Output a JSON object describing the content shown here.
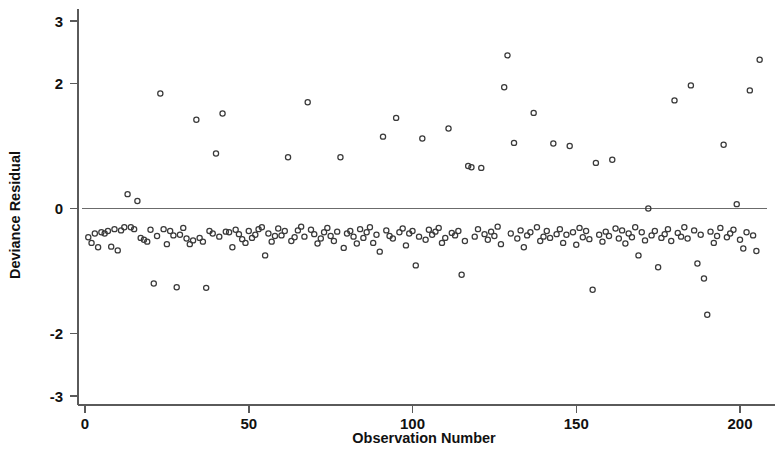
{
  "chart_data": {
    "type": "scatter",
    "title": "",
    "xlabel": "Observation Number",
    "ylabel": "Deviance Residual",
    "xlim": [
      -4,
      212
    ],
    "ylim": [
      -3,
      3
    ],
    "grid": false,
    "legend": null,
    "marker": "open-circle",
    "reference_line": {
      "y": 0,
      "label": "zero-residual-line"
    },
    "xticks": [
      0,
      50,
      100,
      150,
      200
    ],
    "xtick_labels": [
      "0",
      "50",
      "100",
      "150",
      "200"
    ],
    "yticks": [
      3,
      2,
      0,
      -2,
      -3
    ],
    "ytick_labels": [
      "3",
      "2",
      "0",
      "-2",
      "-3"
    ],
    "n_points": 206,
    "x": [
      1,
      2,
      3,
      4,
      5,
      6,
      7,
      8,
      9,
      10,
      11,
      12,
      13,
      14,
      15,
      16,
      17,
      18,
      19,
      20,
      21,
      22,
      23,
      24,
      25,
      26,
      27,
      28,
      29,
      30,
      31,
      32,
      33,
      34,
      35,
      36,
      37,
      38,
      39,
      40,
      41,
      42,
      43,
      44,
      45,
      46,
      47,
      48,
      49,
      50,
      51,
      52,
      53,
      54,
      55,
      56,
      57,
      58,
      59,
      60,
      61,
      62,
      63,
      64,
      65,
      66,
      67,
      68,
      69,
      70,
      71,
      72,
      73,
      74,
      75,
      76,
      77,
      78,
      79,
      80,
      81,
      82,
      83,
      84,
      85,
      86,
      87,
      88,
      89,
      90,
      91,
      92,
      93,
      94,
      95,
      96,
      97,
      98,
      99,
      100,
      101,
      102,
      103,
      104,
      105,
      106,
      107,
      108,
      109,
      110,
      111,
      112,
      113,
      114,
      115,
      116,
      117,
      118,
      119,
      120,
      121,
      122,
      123,
      124,
      125,
      126,
      127,
      128,
      129,
      130,
      131,
      132,
      133,
      134,
      135,
      136,
      137,
      138,
      139,
      140,
      141,
      142,
      143,
      144,
      145,
      146,
      147,
      148,
      149,
      150,
      151,
      152,
      153,
      154,
      155,
      156,
      157,
      158,
      159,
      160,
      161,
      162,
      163,
      164,
      165,
      166,
      167,
      168,
      169,
      170,
      171,
      172,
      173,
      174,
      175,
      176,
      177,
      178,
      179,
      180,
      181,
      182,
      183,
      184,
      185,
      186,
      187,
      188,
      189,
      190,
      191,
      192,
      193,
      194,
      195,
      196,
      197,
      198,
      199,
      200,
      201,
      202,
      203,
      204,
      205,
      206
    ],
    "y": [
      -0.46,
      -0.55,
      -0.4,
      -0.62,
      -0.38,
      -0.4,
      -0.36,
      -0.61,
      -0.33,
      -0.67,
      -0.35,
      -0.3,
      0.23,
      -0.3,
      -0.33,
      0.12,
      -0.47,
      -0.5,
      -0.53,
      -0.34,
      -1.2,
      -0.44,
      1.84,
      -0.33,
      -0.57,
      -0.36,
      -0.43,
      -1.26,
      -0.42,
      -0.31,
      -0.48,
      -0.57,
      -0.51,
      1.42,
      -0.47,
      -0.53,
      -1.27,
      -0.36,
      -0.4,
      0.88,
      -0.45,
      1.52,
      -0.37,
      -0.38,
      -0.62,
      -0.34,
      -0.41,
      -0.49,
      -0.55,
      -0.36,
      -0.47,
      -0.42,
      -0.33,
      -0.3,
      -0.75,
      -0.4,
      -0.53,
      -0.44,
      -0.32,
      -0.43,
      -0.36,
      0.82,
      -0.52,
      -0.46,
      -0.35,
      -0.29,
      -0.45,
      1.7,
      -0.34,
      -0.41,
      -0.56,
      -0.48,
      -0.38,
      -0.31,
      -0.44,
      -0.52,
      -0.37,
      0.82,
      -0.63,
      -0.4,
      -0.36,
      -0.45,
      -0.56,
      -0.33,
      -0.47,
      -0.38,
      -0.3,
      -0.55,
      -0.42,
      -0.69,
      1.15,
      -0.35,
      -0.44,
      -0.48,
      1.45,
      -0.38,
      -0.32,
      -0.59,
      -0.4,
      -0.36,
      -0.91,
      -0.45,
      1.12,
      -0.5,
      -0.34,
      -0.42,
      -0.37,
      -0.31,
      -0.55,
      -0.47,
      1.28,
      -0.39,
      -0.43,
      -0.36,
      -1.06,
      -0.52,
      0.68,
      0.66,
      -0.45,
      -0.33,
      0.65,
      -0.41,
      -0.5,
      -0.37,
      -0.44,
      -0.29,
      -0.57,
      1.94,
      2.45,
      -0.4,
      1.05,
      -0.48,
      -0.35,
      -0.62,
      -0.43,
      -0.38,
      1.53,
      -0.3,
      -0.52,
      -0.45,
      -0.36,
      -0.47,
      1.04,
      -0.41,
      -0.33,
      -0.55,
      -0.42,
      1.0,
      -0.38,
      -0.58,
      -0.31,
      -0.46,
      -0.36,
      -0.49,
      -1.3,
      0.73,
      -0.42,
      -0.53,
      -0.37,
      -0.44,
      0.78,
      -0.32,
      -0.48,
      -0.35,
      -0.56,
      -0.4,
      -0.46,
      -0.3,
      -0.75,
      -0.38,
      -0.51,
      0.0,
      -0.43,
      -0.36,
      -0.94,
      -0.47,
      -0.41,
      -0.33,
      -0.52,
      1.73,
      -0.39,
      -0.45,
      -0.3,
      -0.48,
      1.97,
      -0.35,
      -0.88,
      -0.42,
      -1.12,
      -1.7,
      -0.37,
      -0.55,
      -0.44,
      -0.31,
      1.02,
      -0.46,
      -0.4,
      -0.34,
      0.07,
      -0.5,
      -0.64,
      -0.38,
      1.89,
      -0.43,
      -0.68,
      2.38
    ]
  },
  "axes": {
    "ylabel": "Deviance Residual",
    "xlabel": "Observation Number"
  }
}
